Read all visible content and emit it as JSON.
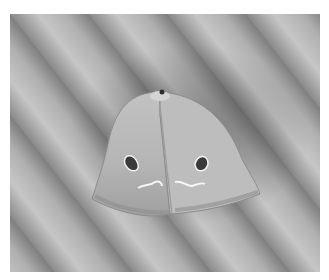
{
  "image": {
    "subject": "moth",
    "description": "Grayscale photograph of a moth resting on a diagonally ridged surface",
    "colors": {
      "background": "#ffffff",
      "surface_light": "#c4c4c4",
      "surface_mid": "#a6a6a6",
      "surface_dark": "#7a7a7a",
      "wing": "#b8b8b8",
      "wing_edge": "#8c8c8c",
      "spot": "#3a3a3a",
      "highlight": "#f4f4f4"
    }
  }
}
